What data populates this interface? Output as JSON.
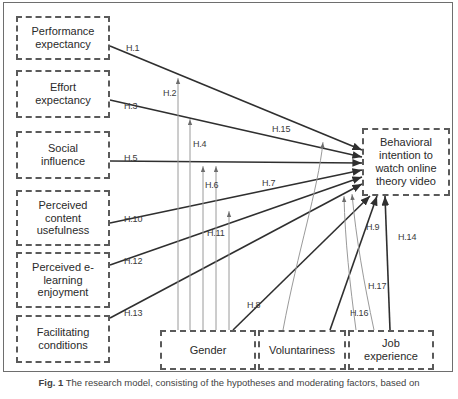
{
  "figure": {
    "caption_prefix": "Fig. 1",
    "caption_text": "The research model, consisting of the hypotheses and moderating factors, based on"
  },
  "predictors": [
    {
      "id": "performance-expectancy",
      "label": "Performance\nexpectancy"
    },
    {
      "id": "effort-expectancy",
      "label": "Effort\nexpectancy"
    },
    {
      "id": "social-influence",
      "label": "Social\ninfluence"
    },
    {
      "id": "perceived-content-usefulness",
      "label": "Perceived\ncontent\nusefulness"
    },
    {
      "id": "perceived-elearning-enjoyment",
      "label": "Perceived e-\nlearning\nenjoyment"
    },
    {
      "id": "facilitating-conditions",
      "label": "Facilitating\nconditions"
    }
  ],
  "outcome": {
    "id": "behavioral-intention",
    "label": "Behavioral\nintention to\nwatch online\ntheory video"
  },
  "moderators": [
    {
      "id": "gender",
      "label": "Gender"
    },
    {
      "id": "voluntariness",
      "label": "Voluntariness"
    },
    {
      "id": "job-experience",
      "label": "Job\nexperience"
    }
  ],
  "hypotheses": [
    {
      "id": "H.1",
      "label": "H.1",
      "kind": "direct",
      "from": "performance-expectancy",
      "to": "behavioral-intention"
    },
    {
      "id": "H.2",
      "label": "H.2",
      "kind": "moderator",
      "from": "gender",
      "to": "H.1"
    },
    {
      "id": "H.3",
      "label": "H.3",
      "kind": "direct",
      "from": "effort-expectancy",
      "to": "behavioral-intention"
    },
    {
      "id": "H.4",
      "label": "H.4",
      "kind": "moderator",
      "from": "gender",
      "to": "H.3"
    },
    {
      "id": "H.5",
      "label": "H.5",
      "kind": "direct",
      "from": "social-influence",
      "to": "behavioral-intention"
    },
    {
      "id": "H.6",
      "label": "H.6",
      "kind": "moderator",
      "from": "gender",
      "to": "H.5"
    },
    {
      "id": "H.7",
      "label": "H.7",
      "kind": "moderator",
      "from": "gender",
      "to": "H.5"
    },
    {
      "id": "H.8",
      "label": "H.8",
      "kind": "direct",
      "from": "voluntariness",
      "to": "behavioral-intention"
    },
    {
      "id": "H.9",
      "label": "H.9",
      "kind": "direct",
      "from": "job-experience",
      "to": "behavioral-intention"
    },
    {
      "id": "H.10",
      "label": "H.10",
      "kind": "direct",
      "from": "perceived-content-usefulness",
      "to": "behavioral-intention"
    },
    {
      "id": "H.11",
      "label": "H.11",
      "kind": "moderator",
      "from": "gender",
      "to": "H.10"
    },
    {
      "id": "H.12",
      "label": "H.12",
      "kind": "direct",
      "from": "perceived-elearning-enjoyment",
      "to": "behavioral-intention"
    },
    {
      "id": "H.13",
      "label": "H.13",
      "kind": "direct",
      "from": "facilitating-conditions",
      "to": "behavioral-intention"
    },
    {
      "id": "H.14",
      "label": "H.14",
      "kind": "direct",
      "from": "job-experience",
      "to": "behavioral-intention"
    },
    {
      "id": "H.15",
      "label": "H.15",
      "kind": "moderator",
      "from": "voluntariness",
      "to": "H.1"
    },
    {
      "id": "H.16",
      "label": "H.16",
      "kind": "moderator",
      "from": "job-experience",
      "to": "behavioral-intention"
    },
    {
      "id": "H.17",
      "label": "H.17",
      "kind": "moderator",
      "from": "job-experience",
      "to": "behavioral-intention"
    }
  ],
  "style": {
    "box_border": "#5a5a5a",
    "direct_line": "#2f2f2f",
    "moderator_line": "#9a9a9a",
    "frame_border": "#6e6e6e",
    "text": "#2a2a2a"
  }
}
